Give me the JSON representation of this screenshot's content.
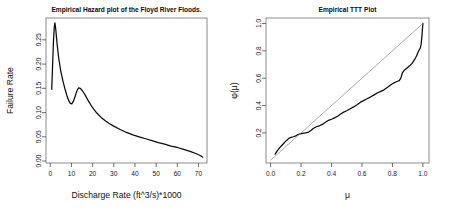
{
  "figure": {
    "width": 450,
    "height": 213,
    "background": "#ffffff",
    "panel_count": 2
  },
  "chart_data": [
    {
      "id": "hazard-plot",
      "type": "line",
      "title": "Empirical Hazard plot of the Floyd River Floods.",
      "xlabel": "Discharge Rate (ft^3/s)*1000",
      "ylabel": "Failure Rate",
      "xlim": [
        -2,
        74
      ],
      "ylim": [
        -0.004,
        0.295
      ],
      "xticks": [
        0,
        10,
        20,
        30,
        40,
        50,
        60,
        70
      ],
      "xticklabels": [
        "0",
        "10",
        "20",
        "30",
        "40",
        "50",
        "60",
        "70"
      ],
      "yticks": [
        0.0,
        0.05,
        0.1,
        0.15,
        0.2,
        0.25
      ],
      "yticklabels": [
        "0.00",
        "0.05",
        "0.10",
        "0.15",
        "0.20",
        "0.25"
      ],
      "grid": false,
      "legend": null,
      "box": true,
      "series": [
        {
          "name": "empirical hazard",
          "color": "#0a0a0a",
          "x": [
            0.7,
            1.1,
            1.5,
            1.9,
            2.2,
            2.6,
            3.2,
            4.0,
            5.0,
            6.0,
            7.0,
            8.0,
            8.8,
            9.5,
            10.2,
            11.0,
            11.8,
            12.6,
            13.4,
            14.2,
            15.2,
            16.5,
            18.0,
            20.0,
            22.0,
            24.0,
            26.0,
            28.0,
            30.0,
            33.0,
            36.0,
            39.0,
            42.0,
            45.0,
            48.0,
            51.0,
            54.0,
            57.0,
            60.0,
            63.0,
            66.0,
            69.0,
            71.0,
            72.0
          ],
          "y": [
            0.148,
            0.196,
            0.244,
            0.276,
            0.285,
            0.272,
            0.243,
            0.212,
            0.185,
            0.165,
            0.148,
            0.133,
            0.124,
            0.119,
            0.118,
            0.124,
            0.134,
            0.145,
            0.151,
            0.15,
            0.145,
            0.136,
            0.124,
            0.11,
            0.099,
            0.09,
            0.083,
            0.077,
            0.072,
            0.065,
            0.059,
            0.054,
            0.05,
            0.046,
            0.042,
            0.038,
            0.035,
            0.031,
            0.028,
            0.024,
            0.02,
            0.015,
            0.011,
            0.008
          ]
        }
      ]
    },
    {
      "id": "ttt-plot",
      "type": "line",
      "title": "Empirical TTT Plot",
      "xlabel": "μ",
      "ylabel": "φ(μ)",
      "xlim": [
        -0.03,
        1.04
      ],
      "ylim": [
        -0.02,
        1.04
      ],
      "xticks": [
        0.0,
        0.2,
        0.4,
        0.6,
        0.8,
        1.0
      ],
      "xticklabels": [
        "0.0",
        "0.2",
        "0.4",
        "0.6",
        "0.8",
        "1.0"
      ],
      "yticks": [
        0.2,
        0.4,
        0.6,
        0.8,
        1.0
      ],
      "yticklabels": [
        "0.2",
        "0.4",
        "0.6",
        "0.8",
        "1.0"
      ],
      "grid": false,
      "legend": null,
      "box": true,
      "series": [
        {
          "name": "empirical TTT",
          "color": "#0a0a0a",
          "x": [
            0.03,
            0.045,
            0.06,
            0.075,
            0.09,
            0.105,
            0.12,
            0.135,
            0.15,
            0.165,
            0.18,
            0.195,
            0.21,
            0.23,
            0.25,
            0.265,
            0.28,
            0.3,
            0.32,
            0.34,
            0.36,
            0.38,
            0.4,
            0.42,
            0.44,
            0.46,
            0.48,
            0.5,
            0.52,
            0.545,
            0.57,
            0.59,
            0.61,
            0.63,
            0.655,
            0.68,
            0.7,
            0.72,
            0.745,
            0.77,
            0.79,
            0.81,
            0.83,
            0.845,
            0.855,
            0.865,
            0.88,
            0.9,
            0.915,
            0.93,
            0.945,
            0.958,
            0.968,
            0.976,
            0.982,
            0.988,
            0.993,
            0.997,
            1.0
          ],
          "y": [
            0.045,
            0.07,
            0.092,
            0.11,
            0.128,
            0.145,
            0.16,
            0.168,
            0.172,
            0.178,
            0.188,
            0.193,
            0.196,
            0.2,
            0.206,
            0.218,
            0.232,
            0.245,
            0.252,
            0.262,
            0.278,
            0.292,
            0.3,
            0.31,
            0.322,
            0.338,
            0.352,
            0.362,
            0.375,
            0.39,
            0.408,
            0.425,
            0.436,
            0.448,
            0.462,
            0.478,
            0.492,
            0.502,
            0.515,
            0.535,
            0.552,
            0.566,
            0.576,
            0.582,
            0.6,
            0.638,
            0.66,
            0.678,
            0.692,
            0.71,
            0.735,
            0.762,
            0.79,
            0.808,
            0.818,
            0.845,
            0.9,
            0.96,
            1.0
          ]
        },
        {
          "name": "45-degree reference line",
          "color": "#8e8e8e",
          "x": [
            0.0,
            1.0
          ],
          "y": [
            0.0,
            1.0
          ]
        }
      ]
    }
  ]
}
